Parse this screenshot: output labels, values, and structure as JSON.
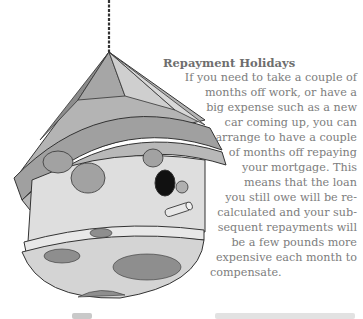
{
  "article": {
    "heading": "Repayment Holidays",
    "lines": [
      "If you need to take a couple of",
      "months off work, or have a",
      "big expense such as a new",
      "car coming up, you can",
      "arrange to have a couple",
      "of months off repaying",
      "your mortgage. This",
      "means that the loan",
      "you still owe will be re-",
      "calculated and your sub-",
      "sequent repayments will",
      "be a few pounds more",
      "expensive each month to",
      "compensate."
    ]
  },
  "illustration": {
    "subject": "hanging birdhouse with cone roof and spotted body",
    "colors": {
      "outline": "#333333",
      "roof_dark": "#8c8c8c",
      "roof_mid": "#a8a8a8",
      "roof_light": "#c8c8c8",
      "body": "#dcdcdc",
      "spots": "#9a9a9a",
      "hole": "#111111"
    }
  }
}
